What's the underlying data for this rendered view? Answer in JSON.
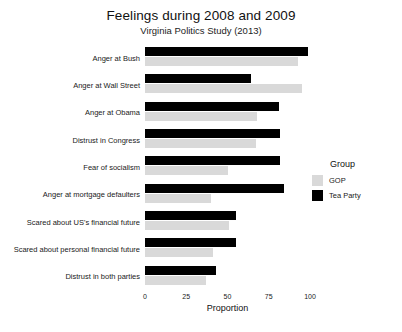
{
  "chart_data": {
    "type": "bar",
    "orientation": "horizontal",
    "title": "Feelings during 2008 and 2009",
    "subtitle": "Virginia Politics Study (2013)",
    "xlabel": "Proportion",
    "ylabel": "",
    "xlim": [
      0,
      100
    ],
    "xticks": [
      0,
      25,
      50,
      75,
      100
    ],
    "xtick_labels": [
      "0",
      "25",
      "50",
      "75",
      "100"
    ],
    "grid": false,
    "legend": {
      "title": "Group",
      "position": "right",
      "entries": [
        {
          "name": "GOP",
          "color": "#d9d9d9"
        },
        {
          "name": "Tea Party",
          "color": "#000000"
        }
      ]
    },
    "categories": [
      "Anger at Bush",
      "Anger at Wall Street",
      "Anger at Obama",
      "Distrust in Congress",
      "Fear of socialism",
      "Anger at mortgage defaulters",
      "Scared about US's financial future",
      "Scared about personal financial future",
      "Distrust in both parties"
    ],
    "series": [
      {
        "name": "Tea Party",
        "color": "#000000",
        "values": [
          99,
          64,
          81,
          82,
          82,
          84,
          55,
          55,
          43
        ]
      },
      {
        "name": "GOP",
        "color": "#d9d9d9",
        "values": [
          93,
          95,
          68,
          67,
          50,
          40,
          51,
          41,
          37
        ]
      }
    ]
  }
}
